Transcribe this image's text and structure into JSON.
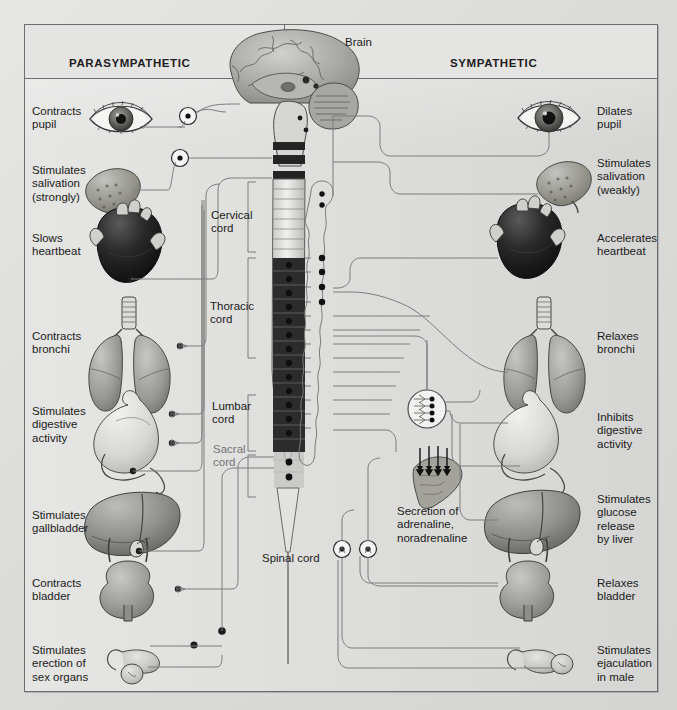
{
  "diagram": {
    "background_color": "#dededc",
    "frame_border_color": "#6e6e6e",
    "header": {
      "left_title": "PARASYMPATHETIC",
      "right_title": "SYMPATHETIC"
    },
    "center_labels": {
      "brain": "Brain",
      "spinal_cord": "Spinal cord",
      "cervical_cord": "Cervical\ncord",
      "thoracic_cord": "Thoracic\ncord",
      "lumbar_cord": "Lumbar\ncord",
      "sacral_cord": "Sacral\ncord",
      "adrenal": "Secretion of\nadrenaline,\nnoradrenaline"
    },
    "parasympathetic_effects": [
      {
        "label": "Contracts\npupil",
        "organ": "eye-icon"
      },
      {
        "label": "Stimulates\nsalivation\n(strongly)",
        "organ": "salivary-gland-icon"
      },
      {
        "label": "Slows\nheartbeat",
        "organ": "heart-icon"
      },
      {
        "label": "Contracts\nbronchi",
        "organ": "lungs-icon"
      },
      {
        "label": "Stimulates\ndigestive\nactivity",
        "organ": "stomach-icon"
      },
      {
        "label": "Stimulates\ngallbladder",
        "organ": "liver-icon"
      },
      {
        "label": "Contracts\nbladder",
        "organ": "bladder-icon"
      },
      {
        "label": "Stimulates\nerection of\nsex organs",
        "organ": "sex-organs-icon"
      }
    ],
    "sympathetic_effects": [
      {
        "label": "Dilates\npupil",
        "organ": "eye-icon"
      },
      {
        "label": "Stimulates\nsalivation\n(weakly)",
        "organ": "salivary-gland-icon"
      },
      {
        "label": "Accelerates\nheartbeat",
        "organ": "heart-icon"
      },
      {
        "label": "Relaxes\nbronchi",
        "organ": "lungs-icon"
      },
      {
        "label": "Inhibits\ndigestive\nactivity",
        "organ": "stomach-icon"
      },
      {
        "label": "Stimulates\nglucose\nrelease\nby liver",
        "organ": "liver-icon"
      },
      {
        "label": "Relaxes\nbladder",
        "organ": "bladder-icon"
      },
      {
        "label": "Stimulates\nejaculation\nin male",
        "organ": "sex-organs-icon"
      }
    ]
  }
}
